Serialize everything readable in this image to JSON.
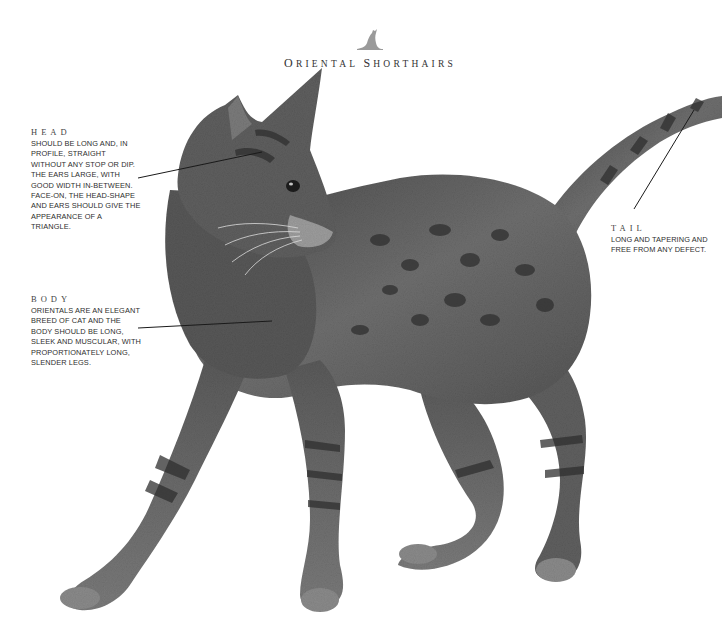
{
  "header": {
    "icon": "cat-silhouette-icon",
    "title_parts": [
      {
        "cap": "O",
        "rest": "RIENTAL"
      },
      {
        "cap": "S",
        "rest": "HORTHAIRS"
      }
    ],
    "title": "Oriental Shorthairs"
  },
  "callouts": {
    "head": {
      "heading": "HEAD",
      "text": "Should be long and, in profile, straight without any stop or dip. The ears large, with good width in-between. Face-on, the head-shape and ears should give the appearance of a triangle."
    },
    "body": {
      "heading": "BODY",
      "text": "Orientals are an elegant breed of cat and the body should be long, sleek and muscular, with proportionately long, slender legs."
    },
    "tail": {
      "heading": "TAIL",
      "text": "Long and tapering and free from any defect."
    }
  },
  "illustration": {
    "subject": "oriental-shorthair-cat",
    "colors": {
      "fur_dark": "#3a3a3a",
      "fur_mid": "#6b6b6b",
      "fur_light": "#8e8e8e",
      "leader_line": "#1a1a1a",
      "logo": "#9a9a9a"
    }
  }
}
